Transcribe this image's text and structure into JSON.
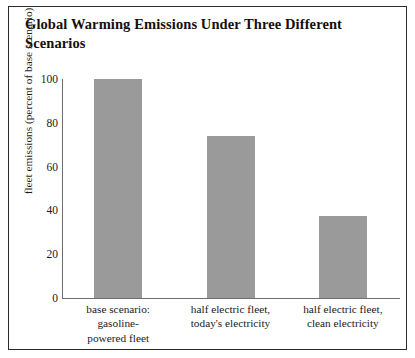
{
  "figure": {
    "title": "Global Warming Emissions Under Three Different Scenarios"
  },
  "chart_data": {
    "type": "bar",
    "title": "Global Warming Emissions Under Three Different Scenarios",
    "xlabel": "",
    "ylabel": "fleet emissions (percent of base scenario)",
    "categories": [
      "base scenario: gasoline-powered fleet",
      "half electric fleet, today's electricity",
      "half electric fleet, clean electricity"
    ],
    "category_lines": [
      [
        "base scenario:",
        "gasoline-",
        "powered fleet"
      ],
      [
        "half electric fleet,",
        "today's electricity"
      ],
      [
        "half electric fleet,",
        "clean electricity"
      ]
    ],
    "values": [
      100,
      74,
      37.5
    ],
    "ylim": [
      0,
      100
    ],
    "yticks": [
      0,
      20,
      40,
      60,
      80,
      100
    ],
    "ytick_labels": [
      "0",
      "20",
      "40",
      "60",
      "80",
      "100"
    ],
    "grid": false,
    "legend": null,
    "bar_color": "#9a9a9a",
    "axis_color": "#6e6e6e",
    "frame_color": "#2b2b2b"
  }
}
